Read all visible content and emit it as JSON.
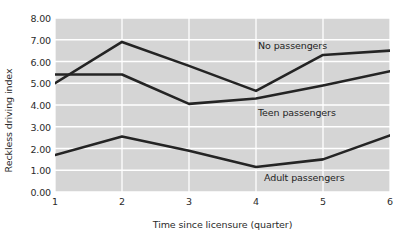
{
  "chart_data": {
    "type": "line",
    "title": "",
    "xlabel": "Time since licensure (quarter)",
    "ylabel": "Reckless driving index",
    "categories": [
      "1",
      "2",
      "3",
      "4",
      "5",
      "6"
    ],
    "x": [
      1,
      2,
      3,
      4,
      5,
      6
    ],
    "xlim": [
      1,
      6
    ],
    "ylim": [
      0.0,
      8.0
    ],
    "ytick_labels": [
      "0.00",
      "1.00",
      "2.00",
      "3.00",
      "4.00",
      "5.00",
      "6.00",
      "7.00",
      "8.00"
    ],
    "ytick_values": [
      0,
      1,
      2,
      3,
      4,
      5,
      6,
      7,
      8
    ],
    "grid": true,
    "grid_color": "#ffffff",
    "panel_color": "#d5d5d5",
    "legend_position": "inline-annotations",
    "line_color": "#242424",
    "series": [
      {
        "name": "No passengers",
        "label_text": "No passengers",
        "values": [
          5.0,
          6.9,
          5.8,
          4.65,
          6.3,
          6.5
        ]
      },
      {
        "name": "Teen passengers",
        "label_text": "Teen passengers",
        "values": [
          5.4,
          5.4,
          4.05,
          4.3,
          4.9,
          5.55
        ]
      },
      {
        "name": "Adult passengers",
        "label_text": "Adult passengers",
        "values": [
          1.7,
          2.55,
          1.9,
          1.15,
          1.5,
          2.6
        ]
      }
    ],
    "annotations": [
      {
        "text": "No passengers",
        "x_px": 258,
        "y_px": 40
      },
      {
        "text": "Teen passengers",
        "x_px": 258,
        "y_px": 107
      },
      {
        "text": "Adult passengers",
        "x_px": 264,
        "y_px": 172
      }
    ]
  }
}
